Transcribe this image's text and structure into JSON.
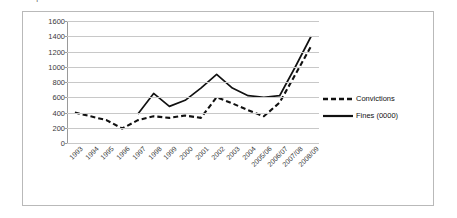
{
  "running_head": {
    "text": "82   |   EXPERT OPINION"
  },
  "chart_data": {
    "type": "line",
    "title": "",
    "subtitle": "",
    "xlabel": "",
    "ylabel": "",
    "grid": true,
    "legend_position": "right",
    "ylim": [
      0,
      1600
    ],
    "yticks": [
      0,
      200,
      400,
      600,
      800,
      1000,
      1200,
      1400,
      1600
    ],
    "ytick_labels": [
      "0",
      "200",
      "400",
      "600",
      "800",
      "1000",
      "1200",
      "1400",
      "1600"
    ],
    "categories": [
      "1993",
      "1994",
      "1995",
      "1996",
      "1997",
      "1998",
      "1999",
      "2000",
      "2001",
      "2002",
      "2003",
      "2004",
      "2005/06",
      "2006/07",
      "2007/08",
      "2008/09"
    ],
    "series": [
      {
        "name": "Convictions",
        "style": "dashed",
        "color": "#111111",
        "values": [
          400,
          350,
          300,
          190,
          300,
          350,
          330,
          360,
          330,
          600,
          520,
          430,
          350,
          530,
          900,
          1270
        ]
      },
      {
        "name": "Fines (0000)",
        "style": "solid",
        "color": "#111111",
        "values": [
          null,
          null,
          null,
          null,
          380,
          650,
          480,
          560,
          720,
          900,
          720,
          620,
          600,
          620,
          1000,
          1400
        ]
      }
    ]
  },
  "legend": {
    "entries": [
      {
        "label": "Convictions",
        "style": "dashed"
      },
      {
        "label": "Fines (0000)",
        "style": "solid"
      }
    ]
  }
}
